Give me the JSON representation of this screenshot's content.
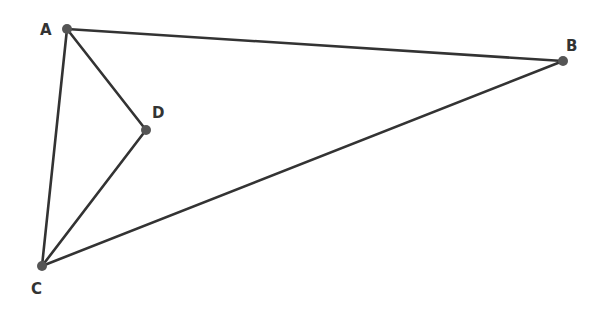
{
  "diagram": {
    "type": "geometry",
    "stroke_color": "#333333",
    "point_color": "#555555",
    "points": [
      {
        "id": "A",
        "label": "A",
        "x": 67,
        "y": 29,
        "lx": 40,
        "ly": 35
      },
      {
        "id": "B",
        "label": "B",
        "x": 563,
        "y": 61,
        "lx": 566,
        "ly": 51
      },
      {
        "id": "C",
        "label": "C",
        "x": 42,
        "y": 266,
        "lx": 31,
        "ly": 294
      },
      {
        "id": "D",
        "label": "D",
        "x": 146,
        "y": 130,
        "lx": 152,
        "ly": 118
      }
    ],
    "segments": [
      {
        "from": "A",
        "to": "B"
      },
      {
        "from": "B",
        "to": "C"
      },
      {
        "from": "C",
        "to": "A"
      },
      {
        "from": "A",
        "to": "D"
      },
      {
        "from": "D",
        "to": "C"
      }
    ]
  }
}
